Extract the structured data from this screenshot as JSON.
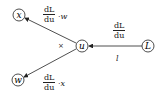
{
  "nodes": {
    "x": {
      "label": "x",
      "cx": 19,
      "cy": 15
    },
    "w": {
      "label": "w",
      "cx": 18,
      "cy": 80
    },
    "u": {
      "label": "u",
      "cx": 82,
      "cy": 46
    },
    "L": {
      "label": "L",
      "cx": 148,
      "cy": 46
    }
  },
  "edges": {
    "L_to_u": {
      "num": "dL",
      "den": "du",
      "below": "l"
    },
    "u_to_x": {
      "num": "dL",
      "den": "du",
      "suffix": "·w"
    },
    "u_to_w": {
      "num": "dL",
      "den": "du",
      "suffix": "·x"
    }
  },
  "operator": "×"
}
